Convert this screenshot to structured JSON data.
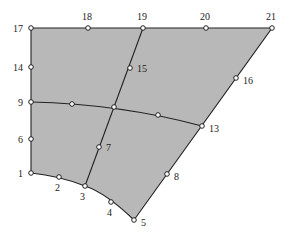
{
  "diagram": {
    "type": "finite-element-mesh",
    "region_fill": "#b8b8b8",
    "line_color": "#222222",
    "nodes": [
      {
        "id": "1",
        "label": "1",
        "x": 31,
        "y": 173,
        "lx": 18,
        "ly": 177
      },
      {
        "id": "2",
        "label": "2",
        "x": 59,
        "y": 177,
        "lx": 55,
        "ly": 191
      },
      {
        "id": "3",
        "label": "3",
        "x": 85,
        "y": 186,
        "lx": 80,
        "ly": 200
      },
      {
        "id": "4",
        "label": "4",
        "x": 111,
        "y": 202,
        "lx": 107,
        "ly": 216
      },
      {
        "id": "5",
        "label": "5",
        "x": 134,
        "y": 220,
        "lx": 141,
        "ly": 226
      },
      {
        "id": "6",
        "label": "6",
        "x": 31,
        "y": 139,
        "lx": 18,
        "ly": 143
      },
      {
        "id": "7",
        "label": "7",
        "x": 99,
        "y": 147,
        "lx": 106,
        "ly": 151
      },
      {
        "id": "8",
        "label": "8",
        "x": 167,
        "y": 174,
        "lx": 174,
        "ly": 180
      },
      {
        "id": "9",
        "label": "9",
        "x": 31,
        "y": 102,
        "lx": 18,
        "ly": 106
      },
      {
        "id": "10",
        "label": "",
        "x": 72,
        "y": 104,
        "lx": 0,
        "ly": 0
      },
      {
        "id": "11",
        "label": "",
        "x": 114,
        "y": 107,
        "lx": 0,
        "ly": 0
      },
      {
        "id": "12",
        "label": "",
        "x": 158,
        "y": 115,
        "lx": 0,
        "ly": 0
      },
      {
        "id": "13",
        "label": "13",
        "x": 202,
        "y": 126,
        "lx": 209,
        "ly": 132
      },
      {
        "id": "14",
        "label": "14",
        "x": 31,
        "y": 67,
        "lx": 13,
        "ly": 71
      },
      {
        "id": "15",
        "label": "15",
        "x": 130,
        "y": 68,
        "lx": 137,
        "ly": 72
      },
      {
        "id": "16",
        "label": "16",
        "x": 236,
        "y": 78,
        "lx": 243,
        "ly": 84
      },
      {
        "id": "17",
        "label": "17",
        "x": 31,
        "y": 28,
        "lx": 13,
        "ly": 32
      },
      {
        "id": "18",
        "label": "18",
        "x": 88,
        "y": 28,
        "lx": 82,
        "ly": 20
      },
      {
        "id": "19",
        "label": "19",
        "x": 143,
        "y": 28,
        "lx": 137,
        "ly": 20
      },
      {
        "id": "20",
        "label": "20",
        "x": 206,
        "y": 28,
        "lx": 200,
        "ly": 20
      },
      {
        "id": "21",
        "label": "21",
        "x": 272,
        "y": 28,
        "lx": 266,
        "ly": 20
      }
    ],
    "boundary_path": "M31,28 L272,28 L134,220 Q106,193 85,186 Q60,176 31,173 Z",
    "internal_edges": [
      {
        "name": "vertical-divider",
        "path": "M143,28 L114,107 L85,186"
      },
      {
        "name": "horizontal-divider",
        "path": "M31,102 Q120,104 202,126"
      }
    ]
  }
}
